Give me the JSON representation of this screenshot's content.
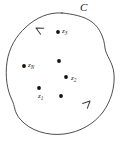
{
  "figure": {
    "name": "contour-integral-diagram",
    "width": 122,
    "height": 141,
    "background_color": "#ffffff",
    "stroke_color": "#3a3a3a",
    "point_color": "#111111"
  },
  "contour": {
    "label": "C",
    "label_x": 80,
    "label_y": 2,
    "orientation": "counterclockwise",
    "closed": true,
    "path": "M 62 13 C 48 12 36 18 26 27 C 16 36 9 48 7 62 C 5 76 7 90 12 100 C 15 106 14 112 20 119 C 30 131 48 136 64 134 C 80 132 94 124 103 112 C 111 101 115 87 114 74 C 113 62 106 56 105 48 C 104 38 100 28 92 22 C 84 16 72 14 62 13 Z",
    "arrows": [
      {
        "name": "arrow-upper-left",
        "x": 36,
        "y": 28,
        "angle": 208
      },
      {
        "name": "arrow-lower-right",
        "x": 90,
        "y": 101,
        "angle": 316
      }
    ]
  },
  "points": [
    {
      "name": "point-z3",
      "label": "z",
      "sub": "3",
      "dot_x": 58,
      "dot_y": 32,
      "label_x": 62,
      "label_y": 28,
      "labeled": true
    },
    {
      "name": "point-zn",
      "label": "z",
      "sub": "N",
      "dot_x": 24,
      "dot_y": 66,
      "label_x": 28,
      "label_y": 62,
      "labeled": true
    },
    {
      "name": "point-z2",
      "label": "z",
      "sub": "2",
      "dot_x": 66,
      "dot_y": 77,
      "label_x": 71,
      "label_y": 75,
      "labeled": true
    },
    {
      "name": "point-z1",
      "label": "z",
      "sub": "1",
      "dot_x": 39,
      "dot_y": 88,
      "label_x": 38,
      "label_y": 93,
      "labeled": true
    },
    {
      "name": "point-unlabeled-center",
      "label": "",
      "sub": "",
      "dot_x": 59,
      "dot_y": 61,
      "label_x": 0,
      "label_y": 0,
      "labeled": false
    },
    {
      "name": "point-unlabeled-lower",
      "label": "",
      "sub": "",
      "dot_x": 61,
      "dot_y": 96,
      "label_x": 0,
      "label_y": 0,
      "labeled": false
    }
  ]
}
